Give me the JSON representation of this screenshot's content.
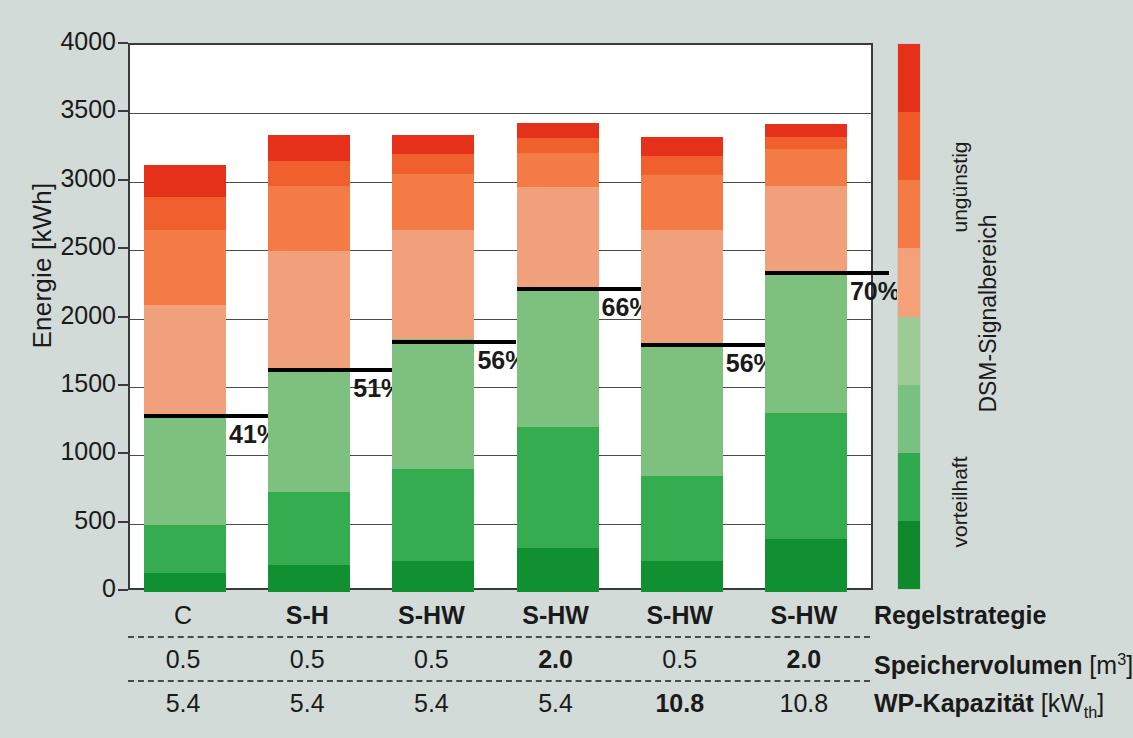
{
  "chart_data": {
    "type": "bar",
    "title": "",
    "xlabel": "",
    "ylabel": "Energie [kWh]",
    "ylim": [
      0,
      4000
    ],
    "ytick_labels": [
      "0",
      "500",
      "1000",
      "1500",
      "2000",
      "2500",
      "3000",
      "3500",
      "4000"
    ],
    "ytick_values": [
      0,
      500,
      1000,
      1500,
      2000,
      2500,
      3000,
      3500,
      4000
    ],
    "grid": true,
    "stacked": true,
    "legend_position": "right",
    "categories": [
      "C",
      "S-H",
      "S-HW",
      "S-HW",
      "S-HW",
      "S-HW"
    ],
    "series": [
      {
        "name": "vorteilhaft-4 (dunkelgrün)",
        "color": "#109030",
        "values": [
          140,
          200,
          230,
          320,
          230,
          390
        ]
      },
      {
        "name": "vorteilhaft-3 (mittelgrün)",
        "color": "#35ac4f",
        "values": [
          350,
          530,
          670,
          890,
          620,
          920
        ]
      },
      {
        "name": "vorteilhaft-2 (hellgrün)",
        "color": "#7ec17e",
        "values": [
          800,
          890,
          950,
          1010,
          960,
          1030
        ]
      },
      {
        "name": "vorteilhaft-1 (blassgrün)",
        "color": "#9fcf9c",
        "values": [
          0,
          0,
          0,
          0,
          0,
          0
        ]
      },
      {
        "name": "ungünstig-1 (hellorange)",
        "color": "#f0a07a",
        "values": [
          810,
          870,
          800,
          740,
          840,
          630
        ]
      },
      {
        "name": "ungünstig-2 (orange)",
        "color": "#f47b45",
        "values": [
          550,
          480,
          410,
          250,
          400,
          270
        ]
      },
      {
        "name": "ungünstig-3 (dunkelorange)",
        "color": "#f0602e",
        "values": [
          235,
          185,
          140,
          110,
          140,
          90
        ]
      },
      {
        "name": "ungünstig-4 (rot)",
        "color": "#e5301a",
        "values": [
          235,
          185,
          140,
          110,
          140,
          90
        ]
      }
    ],
    "bar_totals": [
      3090,
      3225,
      3260,
      3345,
      3225,
      3340
    ],
    "marker_labels": [
      "41%",
      "51%",
      "56%",
      "66%",
      "56%",
      "70%"
    ],
    "marker_values": [
      1290,
      1620,
      1825,
      2215,
      1805,
      2330
    ],
    "colorbar": {
      "top_label": "ungünstig",
      "bottom_label": "vorteilhaft",
      "axis_label": "DSM-Signalbereich",
      "colors_top_to_bottom": [
        "#e5301a",
        "#ef5a28",
        "#f47b45",
        "#f4a179",
        "#9ccb96",
        "#79c183",
        "#2faa4e",
        "#10892c"
      ]
    },
    "table": {
      "row_labels": [
        "Regelstrategie",
        "Speichervolumen [m³]",
        "WP-Kapazität [kW_th]"
      ],
      "rows": [
        {
          "label_main": "Regelstrategie",
          "label_unit": "",
          "cells": [
            {
              "text": "C",
              "bold": false
            },
            {
              "text": "S-H",
              "bold": true
            },
            {
              "text": "S-HW",
              "bold": true
            },
            {
              "text": "S-HW",
              "bold": true
            },
            {
              "text": "S-HW",
              "bold": true
            },
            {
              "text": "S-HW",
              "bold": true
            }
          ]
        },
        {
          "label_main": "Speichervolumen",
          "label_unit": "[m3]",
          "cells": [
            {
              "text": "0.5",
              "bold": false
            },
            {
              "text": "0.5",
              "bold": false
            },
            {
              "text": "0.5",
              "bold": false
            },
            {
              "text": "2.0",
              "bold": true
            },
            {
              "text": "0.5",
              "bold": false
            },
            {
              "text": "2.0",
              "bold": true
            }
          ]
        },
        {
          "label_main": "WP-Kapazität",
          "label_unit": "[kWth]",
          "cells": [
            {
              "text": "5.4",
              "bold": false
            },
            {
              "text": "5.4",
              "bold": false
            },
            {
              "text": "5.4",
              "bold": false
            },
            {
              "text": "5.4",
              "bold": false
            },
            {
              "text": "10.8",
              "bold": true
            },
            {
              "text": "10.8",
              "bold": false
            }
          ]
        }
      ]
    }
  }
}
